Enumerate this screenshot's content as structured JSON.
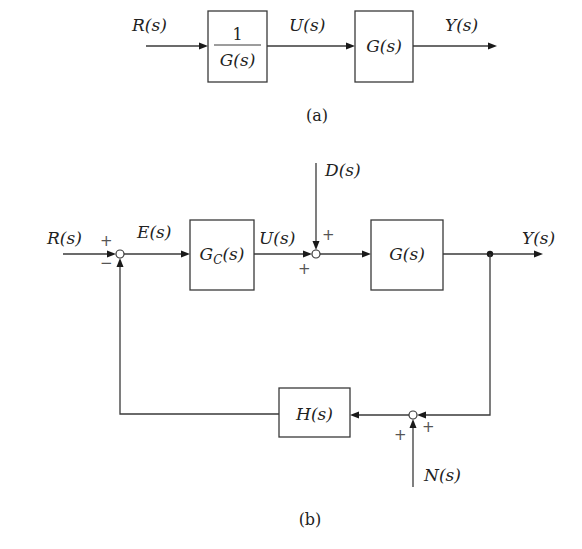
{
  "diagram_a": {
    "caption": "(a)",
    "input_label": "R(s)",
    "block1": {
      "numerator": "1",
      "denominator": "G(s)"
    },
    "signal_between": "U(s)",
    "block2": {
      "label": "G(s)"
    },
    "output_label": "Y(s)"
  },
  "diagram_b": {
    "caption": "(b)",
    "input_label": "R(s)",
    "error_label": "E(s)",
    "controller": {
      "label_main": "G",
      "label_sub": "C",
      "label_tail": "(s)"
    },
    "control_label": "U(s)",
    "disturbance_label": "D(s)",
    "plant": {
      "label": "G(s)"
    },
    "output_label": "Y(s)",
    "feedback": {
      "label": "H(s)"
    },
    "noise_label": "N(s)",
    "summing_junction_1": {
      "sign_top": "+",
      "sign_bottom": "−"
    },
    "summing_junction_2": {
      "sign_top": "+",
      "sign_bottom": "+"
    },
    "summing_junction_3": {
      "sign_left": "+",
      "sign_right": "+"
    }
  }
}
